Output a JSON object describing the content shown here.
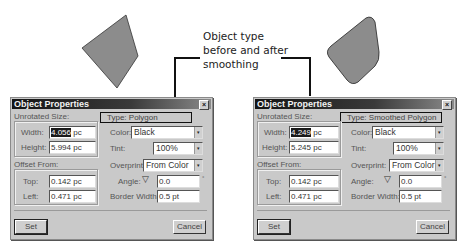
{
  "annotation": {
    "lines": [
      "Object type",
      "before and after",
      "smoothing"
    ]
  },
  "shapes": {
    "before": {
      "name": "polygon",
      "fill": "#8c8c8c",
      "stroke": "#333333"
    },
    "after": {
      "name": "smoothed-polygon",
      "fill": "#8c8c8c",
      "stroke": "#333333"
    }
  },
  "dialogs": [
    {
      "title": "Object Properties",
      "close_label": "×",
      "unrotated_size_label": "Unrotated Size:",
      "width_label": "Width:",
      "width_value": "4.056 pc",
      "width_selected": "4.056",
      "width_unit": " pc",
      "height_label": "Height:",
      "height_value": "5.994 pc",
      "offset_from_label": "Offset From:",
      "top_label": "Top:",
      "top_value": "0.142 pc",
      "left_label": "Left:",
      "left_value": "0.471 pc",
      "type_text": "Type:  Polygon",
      "color_label": "Color:",
      "color_value": "Black",
      "tint_label": "Tint:",
      "tint_value": "100%",
      "overprint_label": "Overprint:",
      "overprint_value": "From Color",
      "angle_label": "Angle:",
      "angle_value": "0.0",
      "border_width_label": "Border Width:",
      "border_width_value": "0.5 pt",
      "set_label": "Set",
      "cancel_label": "Cancel"
    },
    {
      "title": "Object Properties",
      "close_label": "×",
      "unrotated_size_label": "Unrotated Size:",
      "width_label": "Width:",
      "width_value": "4.249 pc",
      "width_selected": "4.249",
      "width_unit": " pc",
      "height_label": "Height:",
      "height_value": "5.245 pc",
      "offset_from_label": "Offset From:",
      "top_label": "Top:",
      "top_value": "0.142 pc",
      "left_label": "Left:",
      "left_value": "0.471 pc",
      "type_text": "Type:  Smoothed Polygon",
      "color_label": "Color:",
      "color_value": "Black",
      "tint_label": "Tint:",
      "tint_value": "100%",
      "overprint_label": "Overprint:",
      "overprint_value": "From Color",
      "angle_label": "Angle:",
      "angle_value": "0.0",
      "border_width_label": "Border Width:",
      "border_width_value": "0.5 pt",
      "set_label": "Set",
      "cancel_label": "Cancel"
    }
  ],
  "icons": {
    "dropdown_arrow": "▾",
    "angle_triangle": "▽"
  }
}
